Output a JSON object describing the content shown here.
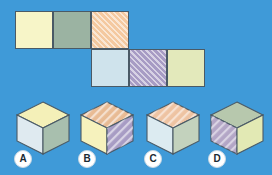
{
  "background_color": "#3f9ad8",
  "puzzle": {
    "type": "cube-net-matching",
    "net": {
      "description": "Unfolded cube net of six squares in a two-row staircase arrangement",
      "rows": 2,
      "columns": 5,
      "edge_color": "#4a5a66",
      "cells": [
        {
          "id": "net-cell-1",
          "row": 0,
          "col": 0,
          "color": "#f7f5c8",
          "color_name": "pale-yellow",
          "pattern": "solid"
        },
        {
          "id": "net-cell-2",
          "row": 0,
          "col": 1,
          "color": "#9bb3a2",
          "color_name": "sage-green",
          "pattern": "solid"
        },
        {
          "id": "net-cell-3",
          "row": 0,
          "col": 2,
          "color": "#f4c9a0",
          "color_name": "peach-orange",
          "pattern": "diagonal-hatch"
        },
        {
          "id": "net-cell-4",
          "row": 1,
          "col": 2,
          "color": "#cfe3ec",
          "color_name": "light-blue",
          "pattern": "solid"
        },
        {
          "id": "net-cell-5",
          "row": 1,
          "col": 3,
          "color": "#a79cc4",
          "color_name": "lavender-purple",
          "pattern": "diagonal-hatch"
        },
        {
          "id": "net-cell-6",
          "row": 1,
          "col": 4,
          "color": "#e3e9bb",
          "color_name": "pale-yellow-green",
          "pattern": "solid"
        }
      ]
    },
    "options": [
      {
        "label": "A",
        "top": {
          "color": "#f4f0b8",
          "color_name": "pale-yellow",
          "pattern": "solid"
        },
        "left": {
          "color": "#dfeaf0",
          "color_name": "light-blue",
          "pattern": "solid"
        },
        "right": {
          "color": "#a8bfae",
          "color_name": "sage-green",
          "pattern": "solid"
        }
      },
      {
        "label": "B",
        "top": {
          "color": "#e8bb94",
          "color_name": "peach-orange",
          "pattern": "diagonal-hatch"
        },
        "left": {
          "color": "#f6f2bd",
          "color_name": "pale-yellow",
          "pattern": "solid"
        },
        "right": {
          "color": "#a79cc4",
          "color_name": "lavender-purple",
          "pattern": "diagonal-hatch"
        }
      },
      {
        "label": "C",
        "top": {
          "color": "#eec3a2",
          "color_name": "peach-orange",
          "pattern": "diagonal-hatch"
        },
        "left": {
          "color": "#dcebf1",
          "color_name": "light-blue",
          "pattern": "solid"
        },
        "right": {
          "color": "#c3d2bd",
          "color_name": "pale-green-gray",
          "pattern": "solid"
        }
      },
      {
        "label": "D",
        "top": {
          "color": "#b7c8ad",
          "color_name": "sage-green",
          "pattern": "solid"
        },
        "left": {
          "color": "#b3a6c6",
          "color_name": "lavender-purple",
          "pattern": "diagonal-hatch"
        },
        "right": {
          "color": "#e2e9b4",
          "color_name": "pale-yellow-green",
          "pattern": "solid"
        }
      }
    ]
  }
}
